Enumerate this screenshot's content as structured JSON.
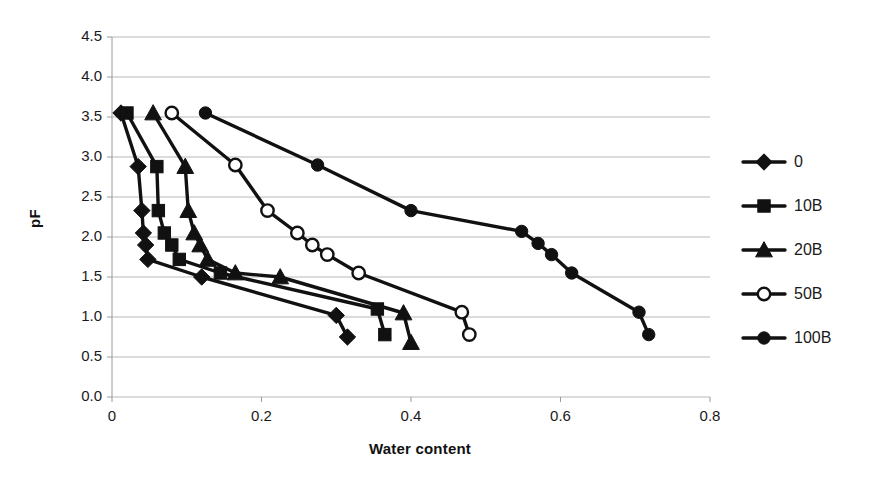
{
  "chart_data": {
    "type": "line",
    "title": "",
    "xlabel": "Water content",
    "ylabel": "pF",
    "xlim": [
      0,
      0.8
    ],
    "ylim": [
      0,
      4.5
    ],
    "xticks": [
      "0",
      "0.2",
      "0.4",
      "0.6",
      "0.8"
    ],
    "xtick_values": [
      0,
      0.2,
      0.4,
      0.6,
      0.8
    ],
    "yticks": [
      "0.0",
      "0.5",
      "1.0",
      "1.5",
      "2.0",
      "2.5",
      "3.0",
      "3.5",
      "4.0",
      "4.5"
    ],
    "ytick_values": [
      0.0,
      0.5,
      1.0,
      1.5,
      2.0,
      2.5,
      3.0,
      3.5,
      4.0,
      4.5
    ],
    "grid": "horizontal",
    "legend_position": "right",
    "series": [
      {
        "name": "0",
        "marker": "diamond",
        "marker_filled": true,
        "color": "#111111",
        "points": [
          [
            0.012,
            3.55
          ],
          [
            0.035,
            2.88
          ],
          [
            0.04,
            2.33
          ],
          [
            0.042,
            2.05
          ],
          [
            0.045,
            1.9
          ],
          [
            0.048,
            1.72
          ],
          [
            0.12,
            1.5
          ],
          [
            0.3,
            1.02
          ],
          [
            0.315,
            0.75
          ]
        ]
      },
      {
        "name": "10B",
        "marker": "square",
        "marker_filled": true,
        "color": "#111111",
        "points": [
          [
            0.02,
            3.55
          ],
          [
            0.06,
            2.88
          ],
          [
            0.062,
            2.33
          ],
          [
            0.07,
            2.05
          ],
          [
            0.08,
            1.9
          ],
          [
            0.09,
            1.72
          ],
          [
            0.145,
            1.55
          ],
          [
            0.355,
            1.1
          ],
          [
            0.365,
            0.78
          ]
        ]
      },
      {
        "name": "20B",
        "marker": "triangle",
        "marker_filled": true,
        "color": "#111111",
        "points": [
          [
            0.055,
            3.55
          ],
          [
            0.098,
            2.88
          ],
          [
            0.102,
            2.33
          ],
          [
            0.11,
            2.05
          ],
          [
            0.118,
            1.9
          ],
          [
            0.128,
            1.72
          ],
          [
            0.165,
            1.55
          ],
          [
            0.225,
            1.5
          ],
          [
            0.39,
            1.05
          ],
          [
            0.4,
            0.68
          ]
        ]
      },
      {
        "name": "50B",
        "marker": "circle",
        "marker_filled": false,
        "color": "#111111",
        "points": [
          [
            0.08,
            3.55
          ],
          [
            0.165,
            2.9
          ],
          [
            0.208,
            2.33
          ],
          [
            0.248,
            2.05
          ],
          [
            0.268,
            1.9
          ],
          [
            0.288,
            1.78
          ],
          [
            0.33,
            1.55
          ],
          [
            0.468,
            1.06
          ],
          [
            0.478,
            0.78
          ]
        ]
      },
      {
        "name": "100B",
        "marker": "circle",
        "marker_filled": true,
        "color": "#111111",
        "points": [
          [
            0.125,
            3.55
          ],
          [
            0.275,
            2.9
          ],
          [
            0.4,
            2.33
          ],
          [
            0.548,
            2.07
          ],
          [
            0.57,
            1.92
          ],
          [
            0.588,
            1.78
          ],
          [
            0.615,
            1.55
          ],
          [
            0.705,
            1.06
          ],
          [
            0.718,
            0.78
          ]
        ]
      }
    ]
  },
  "axes": {
    "x_title": "Water content",
    "y_title": "pF"
  },
  "legend": {
    "entries": [
      {
        "label": "0",
        "marker": "diamond",
        "filled": true
      },
      {
        "label": "10B",
        "marker": "square",
        "filled": true
      },
      {
        "label": "20B",
        "marker": "triangle",
        "filled": true
      },
      {
        "label": "50B",
        "marker": "circle",
        "filled": false
      },
      {
        "label": "100B",
        "marker": "circle",
        "filled": true
      }
    ]
  },
  "style": {
    "line_color": "#111111",
    "grid_color": "#b8b8b8",
    "axis_color": "#9a9a9a",
    "background": "#ffffff"
  }
}
